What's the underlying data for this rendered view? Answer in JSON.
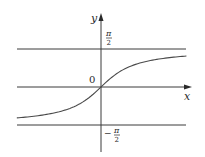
{
  "figure": {
    "function": "arctan",
    "colors": {
      "axis": "#3a3a3a",
      "curve": "#4a4a4a",
      "asymptote": "#3a3a3a",
      "background": "#ffffff"
    },
    "axes": {
      "x_label": "x",
      "y_label": "y",
      "origin_label": "0"
    },
    "asymptotes": [
      {
        "name": "upper",
        "value": "π/2",
        "numerator": "π",
        "denominator": "2",
        "sign": ""
      },
      {
        "name": "lower",
        "value": "-π/2",
        "numerator": "π",
        "denominator": "2",
        "sign": "−"
      }
    ],
    "curve": {
      "x_range": [
        -3.3,
        3.35
      ],
      "description": "increasing S-shaped curve through origin approaching ±π/2"
    }
  }
}
